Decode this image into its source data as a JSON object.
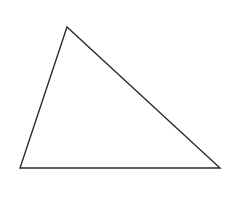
{
  "diagram": {
    "type": "triangle",
    "background": "#ffffff",
    "stroke": "#2a2a2a",
    "stroke_width": 1.4,
    "fill": "none",
    "vertices": [
      {
        "name": "top",
        "x": 67,
        "y": 27
      },
      {
        "name": "bottom-left",
        "x": 20,
        "y": 168
      },
      {
        "name": "bottom-right",
        "x": 220,
        "y": 168
      }
    ],
    "points": "67,27 20,168 220,168"
  }
}
